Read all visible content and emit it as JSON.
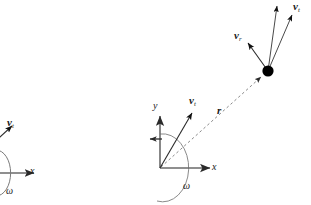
{
  "figure": {
    "background_color": "#ffffff",
    "line_color": "#4a4a4a",
    "dark_line_color": "#1a1a1a",
    "dot_color": "#000000",
    "width": 311,
    "height": 205
  },
  "labels": {
    "x_axis_main": "x",
    "y_axis_main": "y",
    "omega_main": "ω",
    "position_vector": "r",
    "tangential_origin": "v",
    "tangential_origin_sub": "t",
    "tangential_particle": "v",
    "tangential_particle_sub": "t",
    "radial_particle": "v",
    "radial_particle_sub": "r",
    "x_axis_left": "x",
    "omega_left": "ω",
    "tangential_left": "v",
    "tangential_left_sub": "t"
  },
  "geometry": {
    "origin": {
      "x": 160,
      "y": 168
    },
    "particle": {
      "x": 268,
      "y": 71,
      "radius": 5.5
    },
    "x_axis_tip": {
      "x": 216,
      "y": 168
    },
    "y_axis_tip": {
      "x": 160,
      "y": 112
    },
    "vt_origin_tip": {
      "x": 196,
      "y": 110
    },
    "vt_particle_tip": {
      "x": 295,
      "y": 12
    },
    "vertical_arrow_tip": {
      "x": 279,
      "y": 3
    },
    "vr_particle_tip": {
      "x": 245,
      "y": 40
    },
    "left_origin": {
      "x": -6,
      "y": 173
    },
    "left_x_tip": {
      "x": 38,
      "y": 173
    },
    "left_vt_tip": {
      "x": 14,
      "y": 124
    }
  },
  "annotations": {
    "dashed_radius_label": "r",
    "angle_arc_label": "ω",
    "particle_marker": "point-mass"
  }
}
